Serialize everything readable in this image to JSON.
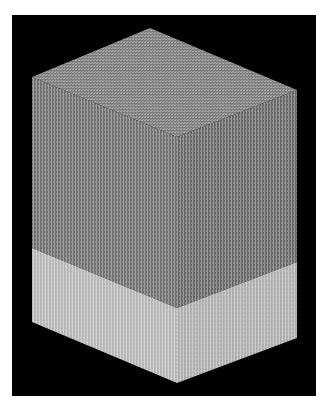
{
  "figure": {
    "kind": "isometric-block",
    "description_visible_text": "",
    "background_color": "#ffffff",
    "frame": {
      "x": 12,
      "y": 15,
      "width": 304,
      "height": 381,
      "color": "#000000"
    },
    "vertices": {
      "top": [
        150,
        28
      ],
      "left_top": [
        32,
        77
      ],
      "right_top": [
        297,
        90
      ],
      "front_top": [
        177,
        137
      ],
      "left_band": [
        32,
        248
      ],
      "front_band": [
        177,
        308
      ],
      "right_band": [
        297,
        262
      ],
      "left_bottom": [
        32,
        322
      ],
      "front_bottom": [
        177,
        383
      ],
      "right_bottom": [
        297,
        338
      ]
    },
    "faces": {
      "top": {
        "base_color": "#7c7c7c",
        "light_color": "#a8a8a8",
        "pattern": "checker"
      },
      "left_upper": {
        "base_color": "#6e6e6e",
        "light_color": "#a0a0a0",
        "pattern": "vertical-stripes"
      },
      "right_upper": {
        "base_color": "#666666",
        "light_color": "#9a9a9a",
        "pattern": "vertical-stripes"
      },
      "left_lower": {
        "base_color": "#b4b4b4",
        "light_color": "#d2d2d2",
        "pattern": "vertical-stripes"
      },
      "right_lower": {
        "base_color": "#acacac",
        "light_color": "#cccccc",
        "pattern": "vertical-stripes"
      }
    }
  }
}
